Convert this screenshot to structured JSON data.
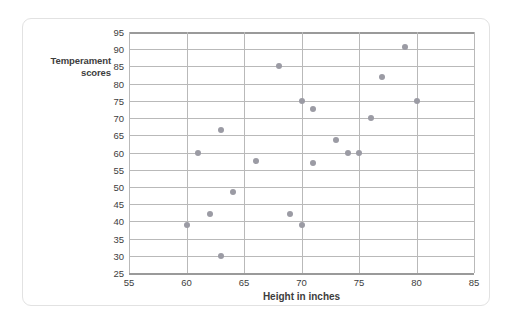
{
  "chart_data": {
    "type": "scatter",
    "title": "",
    "xlabel": "Height in inches",
    "ylabel": "Temperament scores",
    "ylabel_lines": [
      "Temperament",
      "scores"
    ],
    "xlim": [
      55,
      85
    ],
    "ylim": [
      25,
      95
    ],
    "xticks": [
      55,
      60,
      65,
      70,
      75,
      80,
      85
    ],
    "yticks": [
      25,
      30,
      35,
      40,
      45,
      50,
      55,
      60,
      65,
      70,
      75,
      80,
      85,
      90,
      95
    ],
    "grid": "both",
    "legend": "none",
    "marker_color": "#9b9ba4",
    "grid_color": "#b9b9b9",
    "axis_color": "#9a9a9a",
    "text_color": "#3d3d3d",
    "points": [
      {
        "x": 60,
        "y": 39
      },
      {
        "x": 61,
        "y": 60
      },
      {
        "x": 62,
        "y": 42
      },
      {
        "x": 63,
        "y": 66.5
      },
      {
        "x": 63,
        "y": 30
      },
      {
        "x": 64,
        "y": 48.5
      },
      {
        "x": 66,
        "y": 57.5
      },
      {
        "x": 68,
        "y": 85
      },
      {
        "x": 69,
        "y": 42
      },
      {
        "x": 70,
        "y": 75
      },
      {
        "x": 70,
        "y": 39
      },
      {
        "x": 71,
        "y": 72.5
      },
      {
        "x": 71,
        "y": 57
      },
      {
        "x": 73,
        "y": 63.5
      },
      {
        "x": 74,
        "y": 60
      },
      {
        "x": 75,
        "y": 60
      },
      {
        "x": 76,
        "y": 70
      },
      {
        "x": 77,
        "y": 82
      },
      {
        "x": 79,
        "y": 90.5
      },
      {
        "x": 80,
        "y": 75
      }
    ]
  }
}
